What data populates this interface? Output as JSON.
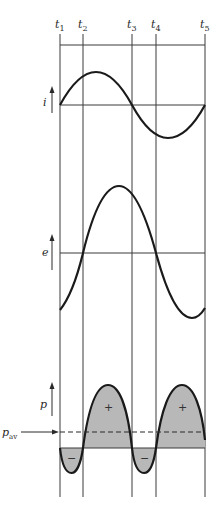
{
  "figure": {
    "time_markers": [
      {
        "label": "t",
        "sub": "1",
        "x": 60
      },
      {
        "label": "t",
        "sub": "2",
        "x": 83
      },
      {
        "label": "t",
        "sub": "3",
        "x": 132
      },
      {
        "label": "t",
        "sub": "4",
        "x": 156
      },
      {
        "label": "t",
        "sub": "5",
        "x": 205
      }
    ],
    "waveforms": {
      "current": {
        "symbol": "i"
      },
      "voltage": {
        "symbol": "e"
      },
      "power": {
        "symbol": "p",
        "average_label": "p",
        "average_sub": "av"
      }
    },
    "power_regions": {
      "positive_sign": "+",
      "negative_sign": "−"
    },
    "colors": {
      "line": "#1a1a1a",
      "grid": "#3a3a3a",
      "fill": "#b8b8b8"
    }
  }
}
